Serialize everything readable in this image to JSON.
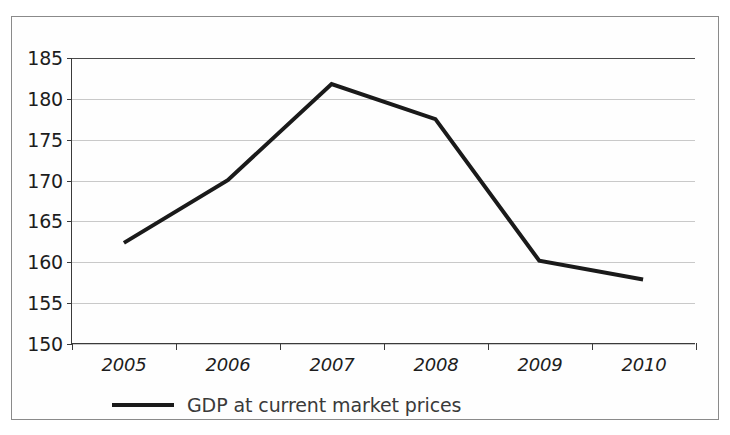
{
  "chart_data": {
    "type": "line",
    "title": "",
    "subtitle": "",
    "xlabel": "",
    "ylabel": "",
    "categories": [
      "2005",
      "2006",
      "2007",
      "2008",
      "2009",
      "2010"
    ],
    "series": [
      {
        "name": "GDP at current market prices",
        "values": [
          162.3,
          170.0,
          181.8,
          177.5,
          160.1,
          157.8
        ],
        "color": "#1a1a1a",
        "line_width": 4
      }
    ],
    "ylim": [
      150,
      185
    ],
    "yticks": [
      150,
      155,
      160,
      165,
      170,
      175,
      180,
      185
    ],
    "ytick_labels": [
      "150",
      "155",
      "160",
      "165",
      "170",
      "175",
      "180",
      "185"
    ],
    "grid": true,
    "grid_axis": "y",
    "grid_color": "#c9c9c9",
    "legend": {
      "position": "bottom",
      "entries": [
        "GDP at current market prices"
      ]
    },
    "axis_color": "#3a3a3a",
    "background_color": "#fefefe",
    "border_color": "#8a8a8a"
  },
  "legend": {
    "label": "GDP at current market prices"
  }
}
